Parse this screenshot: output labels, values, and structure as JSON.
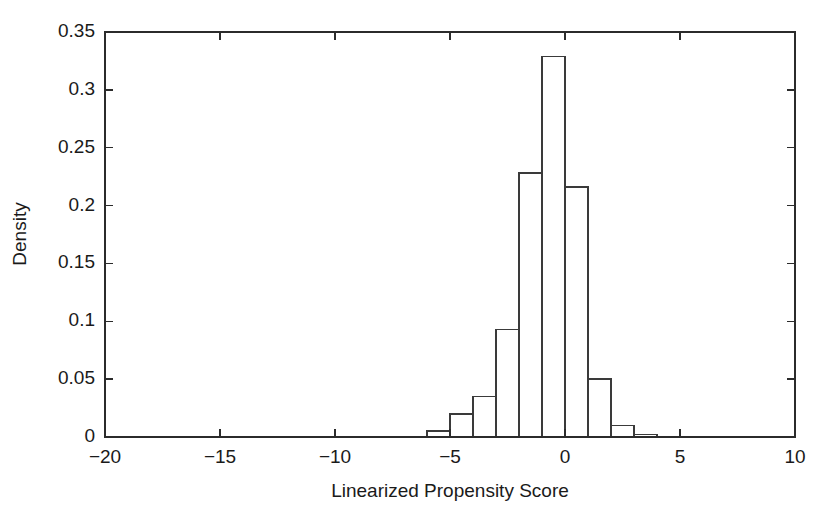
{
  "chart_data": {
    "type": "bar",
    "title": "",
    "subtitle": "",
    "xlabel": "Linearized Propensity Score",
    "ylabel": "Density",
    "xlim": [
      -20,
      10
    ],
    "ylim": [
      0,
      0.35
    ],
    "grid": false,
    "legend": null,
    "bin_width": 1,
    "xticks": [
      -20,
      -15,
      -10,
      -5,
      0,
      5,
      10
    ],
    "xtick_labels": [
      "−20",
      "−15",
      "−10",
      "−5",
      "0",
      "5",
      "10"
    ],
    "yticks": [
      0,
      0.05,
      0.1,
      0.15,
      0.2,
      0.25,
      0.3,
      0.35
    ],
    "ytick_labels": [
      "0",
      "0.05",
      "0.1",
      "0.15",
      "0.2",
      "0.25",
      "0.3",
      "0.35"
    ],
    "bin_edges": [
      -6,
      -5,
      -4,
      -3,
      -2,
      -1,
      0,
      1,
      2,
      3,
      4
    ],
    "categories": [
      "-6 to -5",
      "-5 to -4",
      "-4 to -3",
      "-3 to -2",
      "-2 to -1",
      "-1 to 0",
      "0 to 1",
      "1 to 2",
      "2 to 3",
      "3 to 4"
    ],
    "values": [
      0.005,
      0.02,
      0.035,
      0.093,
      0.228,
      0.329,
      0.216,
      0.05,
      0.01,
      0.002
    ],
    "bar_fill_color": "#ffffff",
    "bar_edge_color": "#3a3a3a",
    "axis_color": "#2b2b2b",
    "background_color": "#ffffff"
  }
}
